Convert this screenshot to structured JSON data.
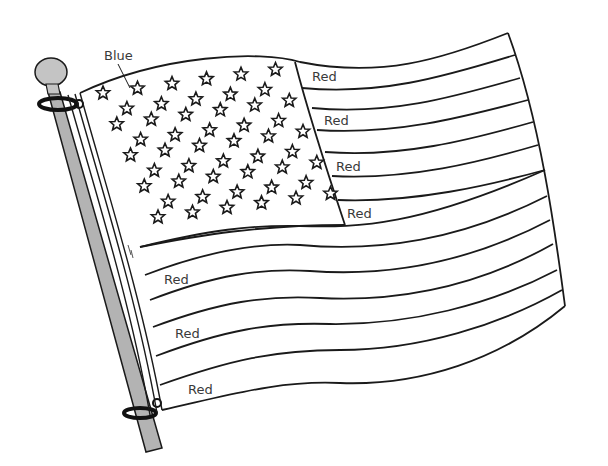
{
  "illustration": {
    "subject": "waving flag coloring page",
    "colors": {
      "line": "#1a1a1a",
      "pole": "#b3b3b3",
      "pole_top": "#c4c4c4",
      "background": "#ffffff"
    },
    "labels": {
      "canton": "Blue",
      "stripes": [
        "Red",
        "Red",
        "Red",
        "Red",
        "Red",
        "Red",
        "Red"
      ]
    },
    "stars_count": 50
  }
}
